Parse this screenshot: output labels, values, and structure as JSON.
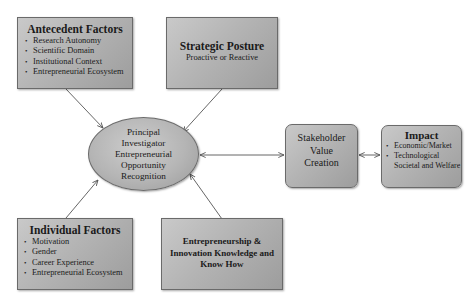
{
  "nodes": {
    "antecedent": {
      "title": "Antecedent Factors",
      "items": [
        "Research Autonomy",
        "Scientific Domain",
        "Institutional Context",
        "Entrepreneurial Ecosystem"
      ]
    },
    "strategic": {
      "title": "Strategic Posture",
      "subtitle": "Proactive or Reactive"
    },
    "individual": {
      "title": "Individual Factors",
      "items": [
        "Motivation",
        "Gender",
        "Career Experience",
        "Entrepreneurial Ecosystem"
      ]
    },
    "knowhow": {
      "lines": [
        "Entrepreneurship &",
        "Innovation Knowledge and",
        "Know How"
      ]
    },
    "center": {
      "lines": [
        "Principal",
        "Investigator",
        "Entrepreneurial",
        "Opportunity",
        "Recognition"
      ]
    },
    "stakeholder": {
      "lines": [
        "Stakeholder",
        "Value",
        "Creation"
      ]
    },
    "impact": {
      "title": "Impact",
      "items": [
        "Economic/Market",
        "Technological Societal and Welfare"
      ]
    }
  },
  "edges": [
    {
      "from": "antecedent",
      "to": "center",
      "type": "arrow"
    },
    {
      "from": "strategic",
      "to": "center",
      "type": "arrow"
    },
    {
      "from": "individual",
      "to": "center",
      "type": "arrow"
    },
    {
      "from": "knowhow",
      "to": "center",
      "type": "arrow"
    },
    {
      "from": "center",
      "to": "stakeholder",
      "type": "bidirectional"
    },
    {
      "from": "stakeholder",
      "to": "impact",
      "type": "bidirectional"
    }
  ],
  "colors": {
    "box_fill": "#b4b4b4",
    "border": "#6a6a6a",
    "arrow": "#555555",
    "text": "#1a1a1a"
  }
}
